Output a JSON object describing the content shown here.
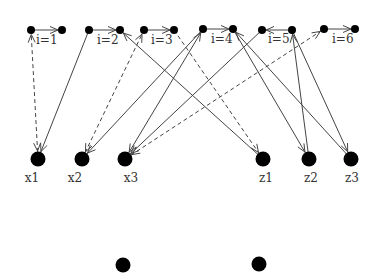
{
  "diagram": {
    "title": "",
    "colors": {
      "node": "#000000",
      "edge": "#444444",
      "label": "#333333"
    },
    "top_pairs": [
      {
        "label": "i=1",
        "left": [
          31,
          30
        ],
        "right": [
          62,
          30
        ],
        "arrow": "right",
        "label_pos": [
          36,
          44
        ]
      },
      {
        "label": "i=2",
        "left": [
          89,
          30
        ],
        "right": [
          120,
          30
        ],
        "arrow": "right",
        "label_pos": [
          97,
          44
        ]
      },
      {
        "label": "i=3",
        "left": [
          144,
          30
        ],
        "right": [
          174,
          30
        ],
        "arrow": "right",
        "label_pos": [
          151,
          44
        ]
      },
      {
        "label": "i=4",
        "left": [
          203,
          29
        ],
        "right": [
          233,
          29
        ],
        "arrow": "right",
        "label_pos": [
          211,
          43
        ]
      },
      {
        "label": "i=5",
        "left": [
          262,
          30
        ],
        "right": [
          292,
          30
        ],
        "arrow": "left",
        "label_pos": [
          268,
          43
        ]
      },
      {
        "label": "i=6",
        "left": [
          324,
          29
        ],
        "right": [
          355,
          29
        ],
        "arrow": "right",
        "label_pos": [
          332,
          43
        ]
      }
    ],
    "middle_nodes": [
      {
        "id": "x1",
        "label": "x1",
        "pos": [
          38,
          159
        ],
        "label_pos": [
          32,
          182
        ]
      },
      {
        "id": "x2",
        "label": "x2",
        "pos": [
          82,
          159
        ],
        "label_pos": [
          75,
          182
        ]
      },
      {
        "id": "x3",
        "label": "x3",
        "pos": [
          125,
          159
        ],
        "label_pos": [
          131,
          182
        ]
      },
      {
        "id": "z1",
        "label": "z1",
        "pos": [
          263,
          159
        ],
        "label_pos": [
          266,
          182
        ]
      },
      {
        "id": "z2",
        "label": "z2",
        "pos": [
          309,
          159
        ],
        "label_pos": [
          311,
          182
        ]
      },
      {
        "id": "z3",
        "label": "z3",
        "pos": [
          351,
          159
        ],
        "label_pos": [
          352,
          182
        ]
      }
    ],
    "bottom_nodes": [
      {
        "id": "b1",
        "pos": [
          123,
          265
        ]
      },
      {
        "id": "b2",
        "pos": [
          259,
          264
        ]
      }
    ],
    "edges": [
      {
        "from": [
          38,
          159
        ],
        "to": [
          31,
          30
        ],
        "style": "dashed",
        "arrow_end": true,
        "arrow_start": true
      },
      {
        "from": [
          89,
          30
        ],
        "to": [
          38,
          159
        ],
        "style": "solid",
        "arrow_end": true
      },
      {
        "from": [
          82,
          159
        ],
        "to": [
          144,
          30
        ],
        "style": "dashed",
        "arrow_end": true,
        "arrow_start": true
      },
      {
        "from": [
          203,
          29
        ],
        "to": [
          82,
          159
        ],
        "style": "solid",
        "arrow_end": true
      },
      {
        "from": [
          203,
          29
        ],
        "to": [
          125,
          159
        ],
        "style": "solid",
        "arrow_end": true,
        "arrow_start": true
      },
      {
        "from": [
          262,
          30
        ],
        "to": [
          125,
          159
        ],
        "style": "solid",
        "arrow_end": true
      },
      {
        "from": [
          125,
          159
        ],
        "to": [
          324,
          29
        ],
        "style": "dashed",
        "arrow_end": true,
        "arrow_start": true
      },
      {
        "from": [
          263,
          159
        ],
        "to": [
          120,
          30
        ],
        "style": "solid",
        "arrow_end": true
      },
      {
        "from": [
          174,
          30
        ],
        "to": [
          263,
          159
        ],
        "style": "dashed",
        "arrow_end": true
      },
      {
        "from": [
          233,
          29
        ],
        "to": [
          309,
          159
        ],
        "style": "solid",
        "arrow_end": true
      },
      {
        "from": [
          309,
          159
        ],
        "to": [
          292,
          30
        ],
        "style": "solid",
        "arrow_end": true
      },
      {
        "from": [
          351,
          159
        ],
        "to": [
          233,
          29
        ],
        "style": "solid",
        "arrow_end": true
      },
      {
        "from": [
          292,
          30
        ],
        "to": [
          351,
          159
        ],
        "style": "solid",
        "arrow_end": true
      }
    ]
  }
}
